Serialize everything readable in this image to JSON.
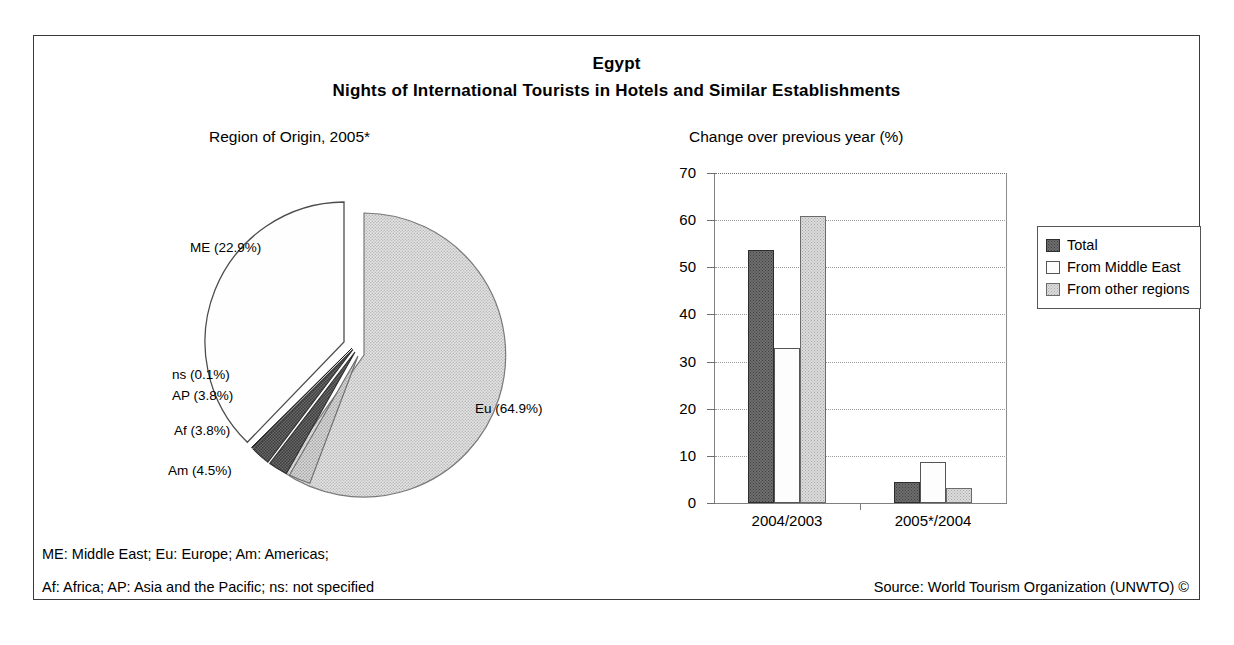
{
  "titles": {
    "country": "Egypt",
    "subject": "Nights of International Tourists in Hotels and Similar Establishments",
    "pie_panel": "Region of Origin, 2005*",
    "bar_panel": "Change over previous year (%)"
  },
  "footnotes": {
    "abbr_line_1": "ME: Middle East; Eu: Europe; Am: Americas;",
    "abbr_line_2": "Af: Africa; AP: Asia and the Pacific; ns: not specified",
    "source": "Source: World Tourism Organization (UNWTO) ©"
  },
  "colors": {
    "frame_border": "#3a3a3a",
    "total_fill": "#6e6e6e",
    "middle_east_fill": "#fdfdfd",
    "other_regions_fill": "#dcdcdc",
    "eu_slice": "#dedede",
    "me_slice": "#fefefe",
    "am_slice": "#d6d6d6",
    "af_slice": "#585858",
    "ap_slice": "#4a4a4a",
    "ns_slice": "#2a2a2a",
    "gridline": "#9a9a9a",
    "axis": "#808080"
  },
  "chart_data": [
    {
      "type": "pie",
      "title": "Region of Origin, 2005*",
      "unit": "%",
      "labels": [
        "Eu (64.9%)",
        "ME (22.9%)",
        "Am (4.5%)",
        "Af (3.8%)",
        "AP (3.8%)",
        "ns (0.1%)"
      ],
      "categories": [
        "Eu",
        "ME",
        "Am",
        "Af",
        "AP",
        "ns"
      ],
      "values": [
        64.9,
        22.9,
        4.5,
        3.8,
        3.8,
        0.1
      ],
      "exploded": true,
      "legend": "none"
    },
    {
      "type": "bar",
      "title": "Change over previous year (%)",
      "xlabel": "",
      "ylabel": "",
      "ylim": [
        0,
        70
      ],
      "yticks": [
        0,
        10,
        20,
        30,
        40,
        50,
        60,
        70
      ],
      "ytick_labels": [
        "0",
        "10",
        "20",
        "30",
        "40",
        "50",
        "60",
        "70"
      ],
      "categories": [
        "2004/2003",
        "2005*/2004"
      ],
      "grid": true,
      "legend_position": "right",
      "series": [
        {
          "name": "Total",
          "values": [
            53.7,
            4.4
          ]
        },
        {
          "name": "From Middle East",
          "values": [
            32.8,
            8.7
          ]
        },
        {
          "name": "From other regions",
          "values": [
            60.8,
            3.2
          ]
        }
      ]
    }
  ],
  "pie_labels": [
    {
      "text": "ME (22.9%)",
      "x": 120,
      "y": 85
    },
    {
      "text": "ns (0.1%)",
      "x": 102,
      "y": 212
    },
    {
      "text": "AP (3.8%)",
      "x": 102,
      "y": 233
    },
    {
      "text": "Af (3.8%)",
      "x": 104,
      "y": 268
    },
    {
      "text": "Am (4.5%)",
      "x": 98,
      "y": 308
    },
    {
      "text": "Eu (64.9%)",
      "x": 405,
      "y": 246
    }
  ],
  "legend": {
    "items": [
      {
        "label": "Total",
        "swatch": "total"
      },
      {
        "label": "From Middle East",
        "swatch": "middle-east"
      },
      {
        "label": "From other regions",
        "swatch": "other-regions"
      }
    ]
  }
}
